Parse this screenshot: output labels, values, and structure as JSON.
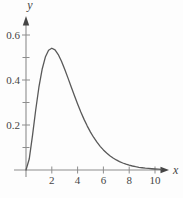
{
  "chart_data": {
    "type": "line",
    "title": "",
    "xlabel": "x",
    "ylabel": "y",
    "xlim": [
      0,
      10.8
    ],
    "ylim": [
      0,
      0.65
    ],
    "x_ticks": [
      2,
      4,
      6,
      8,
      10
    ],
    "x_tick_labels": [
      "2",
      "4",
      "6",
      "8",
      "10"
    ],
    "y_ticks_labeled": [
      0.2,
      0.4,
      0.6
    ],
    "y_tick_labels": [
      "0.2",
      "0.4",
      "0.6"
    ],
    "y_ticks_minor": [
      0.1,
      0.3,
      0.5
    ],
    "grid": false,
    "legend": false,
    "series": [
      {
        "name": "curve",
        "points": [
          [
            0,
            0
          ],
          [
            0.25,
            0.0487
          ],
          [
            0.5,
            0.1516
          ],
          [
            0.75,
            0.2657
          ],
          [
            1,
            0.3679
          ],
          [
            1.25,
            0.4477
          ],
          [
            1.5,
            0.502
          ],
          [
            1.75,
            0.5322
          ],
          [
            2,
            0.5413
          ],
          [
            2.25,
            0.5336
          ],
          [
            2.5,
            0.513
          ],
          [
            2.75,
            0.4835
          ],
          [
            3,
            0.4481
          ],
          [
            3.25,
            0.4095
          ],
          [
            3.5,
            0.3699
          ],
          [
            3.75,
            0.3307
          ],
          [
            4,
            0.2931
          ],
          [
            4.25,
            0.2576
          ],
          [
            4.5,
            0.225
          ],
          [
            4.75,
            0.1952
          ],
          [
            5,
            0.1684
          ],
          [
            5.25,
            0.1446
          ],
          [
            5.5,
            0.1236
          ],
          [
            5.75,
            0.1052
          ],
          [
            6,
            0.0892
          ],
          [
            6.25,
            0.0754
          ],
          [
            6.5,
            0.0635
          ],
          [
            6.75,
            0.0534
          ],
          [
            7,
            0.0447
          ],
          [
            7.25,
            0.0373
          ],
          [
            7.5,
            0.0311
          ],
          [
            7.75,
            0.0259
          ],
          [
            8,
            0.0215
          ],
          [
            8.25,
            0.0178
          ],
          [
            8.5,
            0.0147
          ],
          [
            8.75,
            0.0121
          ],
          [
            9,
            0.01
          ],
          [
            9.25,
            0.0082
          ],
          [
            9.5,
            0.0068
          ],
          [
            9.75,
            0.0055
          ],
          [
            10,
            0.0045
          ],
          [
            10.25,
            0.0037
          ],
          [
            10.5,
            0.003
          ]
        ]
      }
    ],
    "colors": {
      "axis": "#8d8d8d",
      "curve": "#595959",
      "labels": "#454545",
      "background": "#fdfdfd"
    }
  }
}
